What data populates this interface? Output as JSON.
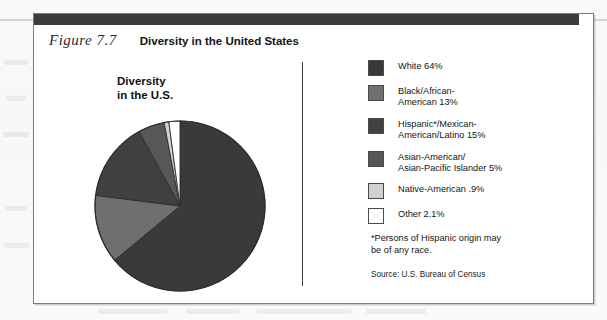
{
  "figure": {
    "label": "Figure  7.7",
    "title": "Diversity in the United States",
    "caption": "Diversity\nin the U.S."
  },
  "chart_data": {
    "type": "pie",
    "title": "Diversity in the U.S.",
    "legend_position": "right",
    "start_angle_deg": 0,
    "direction": "clockwise",
    "categories": [
      "White",
      "Black/African-American",
      "Hispanic*/Mexican-American/Latino",
      "Asian-American/Asian-Pacific Islander",
      "Native-American",
      "Other"
    ],
    "values": [
      64,
      13,
      15,
      5,
      0.9,
      2.1
    ],
    "value_labels": [
      "64%",
      "13%",
      "15%",
      "5%",
      ".9%",
      "2.1%"
    ],
    "colors": [
      "#3a3a3a",
      "#6f6f6f",
      "#404040",
      "#575757",
      "#d2d2d2",
      "#ffffff"
    ],
    "units": "percent",
    "footnote": "*Persons of Hispanic origin may\n be of any race.",
    "source": "Source: U.S. Bureau of Census"
  },
  "legend": {
    "items": [
      {
        "label": "White 64%",
        "color": "#3a3a3a"
      },
      {
        "label": "Black/African-\nAmerican 13%",
        "color": "#6f6f6f"
      },
      {
        "label": "Hispanic*/Mexican-\nAmerican/Latino 15%",
        "color": "#404040"
      },
      {
        "label": "Asian-American/\nAsian-Pacific Islander 5%",
        "color": "#575757"
      },
      {
        "label": "Native-American .9%",
        "color": "#d2d2d2"
      },
      {
        "label": "Other 2.1%",
        "color": "#ffffff"
      }
    ],
    "footnote": "*Persons of Hispanic origin may\n be of any race.",
    "source": "Source: U.S. Bureau of Census"
  }
}
